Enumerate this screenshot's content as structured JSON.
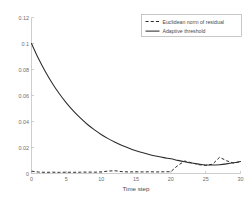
{
  "chart_data": {
    "type": "line",
    "title": "",
    "xlabel": "Time step",
    "ylabel": "",
    "xlim": [
      0,
      30
    ],
    "ylim": [
      0,
      0.12
    ],
    "grid": false,
    "legend_position": "top-right",
    "xticks": [
      "0",
      "5",
      "10",
      "15",
      "20",
      "25",
      "30"
    ],
    "xtick_values": [
      0,
      5,
      10,
      15,
      20,
      25,
      30
    ],
    "yticks": [
      "0",
      "0.02",
      "0.04",
      "0.06",
      "0.08",
      "0.1",
      "0.12"
    ],
    "ytick_values": [
      0,
      0.02,
      0.04,
      0.06,
      0.08,
      0.1,
      0.12
    ],
    "x": [
      0,
      1,
      2,
      3,
      4,
      5,
      6,
      7,
      8,
      9,
      10,
      11,
      12,
      13,
      14,
      15,
      16,
      17,
      18,
      19,
      20,
      21,
      22,
      23,
      24,
      25,
      26,
      27,
      28,
      29,
      30
    ],
    "series": [
      {
        "name": "Euclidean norm of residual",
        "style": "dashed",
        "color": "#2b2b2b",
        "values": [
          0.0018,
          0.0011,
          0.0009,
          0.001,
          0.0009,
          0.001,
          0.0009,
          0.001,
          0.0011,
          0.001,
          0.0012,
          0.0019,
          0.0021,
          0.0014,
          0.0012,
          0.0013,
          0.0012,
          0.0013,
          0.0012,
          0.0013,
          0.0014,
          0.0062,
          0.0096,
          0.0082,
          0.0068,
          0.0062,
          0.0072,
          0.0125,
          0.0098,
          0.008,
          0.0092
        ]
      },
      {
        "name": "Adaptive threshold",
        "style": "solid",
        "color": "#2b2b2b",
        "values": [
          0.1,
          0.0884,
          0.0782,
          0.0692,
          0.0613,
          0.0543,
          0.0481,
          0.0427,
          0.0379,
          0.0337,
          0.03,
          0.0268,
          0.024,
          0.0215,
          0.0194,
          0.0175,
          0.0159,
          0.0145,
          0.0133,
          0.0122,
          0.0113,
          0.0101,
          0.009,
          0.008,
          0.0072,
          0.0066,
          0.0065,
          0.0068,
          0.0074,
          0.0082,
          0.0092
        ]
      }
    ],
    "legend_entries": [
      {
        "label": "Euclidean norm of residual",
        "style": "dashed"
      },
      {
        "label": "Adaptive threshold",
        "style": "solid"
      }
    ]
  }
}
